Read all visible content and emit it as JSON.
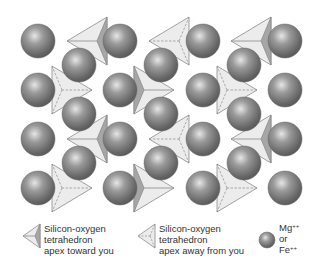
{
  "diagram": {
    "colors": {
      "sphere_dark": "#555555",
      "sphere_mid": "#8a8a8a",
      "sphere_light": "#e8e8e8",
      "tetra_face": "#ececec",
      "tetra_dark_face": "#a6a6a6",
      "tetra_edge": "#8c8c8c"
    },
    "outer_sphere_columns_x": [
      38,
      120,
      203,
      285
    ],
    "outer_sphere_rows_y": [
      41,
      90,
      139,
      188
    ],
    "inner_sphere_columns_x": [
      79,
      161,
      244
    ],
    "inner_sphere_rows_y": [
      65,
      114,
      163
    ],
    "sphere_radius": 17,
    "tetrahedra_rows": [
      {
        "direction": "left",
        "center_y": 41,
        "types": [
          "toward",
          "away",
          "toward"
        ]
      },
      {
        "direction": "right",
        "center_y": 90,
        "types": [
          "away",
          "toward",
          "away"
        ]
      },
      {
        "direction": "left",
        "center_y": 139,
        "types": [
          "toward",
          "away",
          "toward"
        ]
      },
      {
        "direction": "right",
        "center_y": 188,
        "types": [
          "away",
          "toward",
          "away"
        ]
      }
    ]
  },
  "legend": {
    "toward": {
      "line1": "Silicon-oxygen",
      "line2": "tetrahedron",
      "line3": "apex toward you"
    },
    "away": {
      "line1": "Silicon-oxygen",
      "line2": "tetrahedron",
      "line3": "apex away from you"
    },
    "cation": {
      "line1_base": "Mg",
      "line1_sup": "++",
      "line2": "or",
      "line3_base": "Fe",
      "line3_sup": "++"
    }
  }
}
